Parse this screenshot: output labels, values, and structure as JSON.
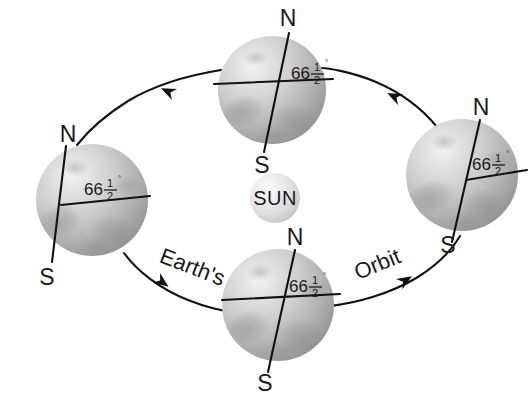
{
  "diagram": {
    "background_color": "#ffffff",
    "ink_color": "#111111",
    "sun": {
      "label": "SUN",
      "cx": 275,
      "cy": 198,
      "r": 25
    },
    "orbit": {
      "center_x": 272,
      "center_y": 198,
      "radius_x": 196,
      "radius_y": 120,
      "direction": "counterclockwise",
      "words": [
        {
          "text": "Earth's",
          "x": 190,
          "y": 270,
          "rotation": 22
        },
        {
          "text": "Orbit",
          "x": 378,
          "y": 268,
          "rotation": -24
        }
      ],
      "arrowheads": [
        {
          "name": "arrow-top-left",
          "x": 160,
          "y": 98,
          "rotation": 203
        },
        {
          "name": "arrow-top-right",
          "x": 385,
          "y": 98,
          "rotation": -23
        },
        {
          "name": "arrow-bottom-left",
          "x": 172,
          "y": 282,
          "rotation": 42
        },
        {
          "name": "arrow-bottom-right",
          "x": 385,
          "y": 283,
          "rotation": -41
        }
      ]
    },
    "angle_label": {
      "whole": "66",
      "numerator": "1",
      "denominator": "2",
      "degree_symbol": "°",
      "full_text": "66 1/2 degrees"
    },
    "earths": [
      {
        "id": "earth-left",
        "position": "left",
        "cx": 92,
        "cy": 200,
        "r": 56,
        "axis_tilt_deg": 23.5,
        "north_label": "N",
        "south_label": "S",
        "north_x": 70,
        "north_y": 138,
        "south_x": 48,
        "south_y": 277,
        "angle_x": 104,
        "angle_y": 188
      },
      {
        "id": "earth-top",
        "position": "top",
        "cx": 272,
        "cy": 90,
        "r": 54,
        "axis_tilt_deg": 23.5,
        "north_label": "N",
        "south_label": "S",
        "north_x": 285,
        "north_y": 22,
        "south_x": 258,
        "south_y": 166,
        "angle_x": 285,
        "angle_y": 76
      },
      {
        "id": "earth-right",
        "position": "right",
        "cx": 462,
        "cy": 175,
        "r": 56,
        "axis_tilt_deg": 23.5,
        "north_label": "N",
        "south_label": "S",
        "north_x": 478,
        "north_y": 112,
        "south_x": 447,
        "south_y": 250,
        "angle_x": 474,
        "angle_y": 162
      },
      {
        "id": "earth-bottom",
        "position": "bottom",
        "cx": 278,
        "cy": 305,
        "r": 56,
        "axis_tilt_deg": 23.5,
        "north_label": "N",
        "south_label": "S",
        "north_x": 290,
        "north_y": 244,
        "south_x": 265,
        "south_y": 383,
        "angle_x": 290,
        "angle_y": 292
      }
    ]
  }
}
